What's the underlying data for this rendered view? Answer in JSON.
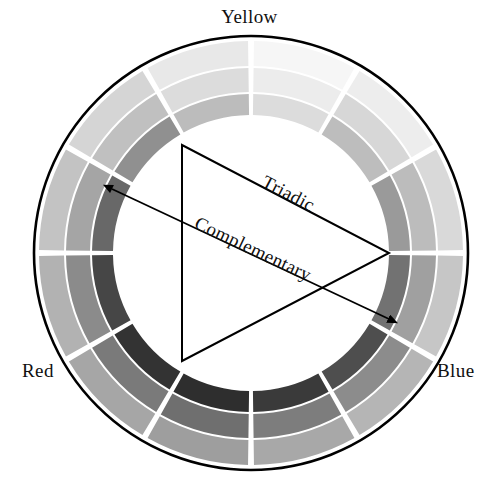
{
  "diagram": {
    "type": "color-wheel",
    "center": {
      "x": 251,
      "y": 253
    },
    "radii": {
      "outline_outer": 217,
      "ring_outer_outer": 212,
      "ring_outer_inner": 187,
      "ring_middle_outer": 185,
      "ring_middle_inner": 161,
      "ring_inner_outer": 159,
      "ring_inner_inner": 138
    },
    "segment_count": 12,
    "segment_gap_degrees": 1.6,
    "outline_color": "#000000",
    "gap_color": "#ffffff",
    "background_color": "#ffffff"
  },
  "primary_labels": [
    {
      "name": "yellow",
      "text": "Yellow",
      "position": "top"
    },
    {
      "name": "red",
      "text": "Red",
      "position": "bottom-left"
    },
    {
      "name": "blue",
      "text": "Blue",
      "position": "bottom-right"
    }
  ],
  "relation_labels": [
    {
      "name": "triadic",
      "text": "Triadic"
    },
    {
      "name": "complementary",
      "text": "Complementary"
    }
  ],
  "chart_data": {
    "type": "pie",
    "categories": [
      "Yellow",
      "Yellow-Green",
      "Green",
      "Blue-Green",
      "Blue",
      "Blue-Violet",
      "Violet",
      "Red-Violet",
      "Red",
      "Red-Orange",
      "Orange",
      "Yellow-Orange"
    ],
    "values": [
      30,
      30,
      30,
      30,
      30,
      30,
      30,
      30,
      30,
      30,
      30,
      30
    ],
    "start_angle_degrees": -90,
    "series": [
      {
        "name": "outer-ring-tint",
        "ring": "outer",
        "values": [
          "#f6f6f6",
          "#ededed",
          "#d9d9d9",
          "#c6c6c6",
          "#b5b5b5",
          "#a8a8a8",
          "#9e9e9e",
          "#a6a6a6",
          "#b2b2b2",
          "#c3c3c3",
          "#d5d5d5",
          "#e8e8e8"
        ]
      },
      {
        "name": "middle-ring-base",
        "ring": "middle",
        "values": [
          "#ececec",
          "#d7d7d7",
          "#bcbcbc",
          "#a0a0a0",
          "#8c8c8c",
          "#7d7d7d",
          "#6f6f6f",
          "#7a7a7a",
          "#8b8b8b",
          "#a5a5a5",
          "#c0c0c0",
          "#dcdcdc"
        ]
      },
      {
        "name": "inner-ring-shade",
        "ring": "inner",
        "values": [
          "#dcdcdc",
          "#bdbdbd",
          "#9a9a9a",
          "#727272",
          "#4e4e4e",
          "#3a3a3a",
          "#2e2e2e",
          "#333333",
          "#464646",
          "#686868",
          "#909090",
          "#bcbcbc"
        ]
      }
    ],
    "xlabel": "",
    "ylabel": "",
    "legend": [
      "Yellow",
      "Red",
      "Blue"
    ]
  },
  "annotations": {
    "triadic": {
      "name": "triadic-triangle",
      "description": "Equilateral triangle connecting three equidistant hues",
      "vertices": [
        {
          "x": 182,
          "y": 145
        },
        {
          "x": 182,
          "y": 361
        },
        {
          "x": 389,
          "y": 253
        }
      ],
      "stroke": "#000000",
      "stroke_width": 2,
      "label_text": "Triadic"
    },
    "complementary": {
      "name": "complementary-arrow",
      "description": "Double headed arrow connecting two opposite hues",
      "from": {
        "x": 108,
        "y": 186
      },
      "to": {
        "x": 393,
        "y": 320
      },
      "stroke": "#000000",
      "stroke_width": 1.8,
      "label_text": "Complementary"
    }
  }
}
